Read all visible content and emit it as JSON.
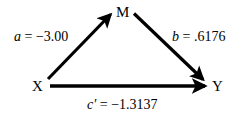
{
  "diagram": {
    "type": "mediation-path-diagram",
    "background_color": "#ffffff",
    "stroke_color": "#000000",
    "nodes": [
      {
        "id": "X",
        "label": "X",
        "role": "independent-variable",
        "x": 38,
        "y": 86
      },
      {
        "id": "M",
        "label": "M",
        "role": "mediator-variable",
        "x": 122,
        "y": 12
      },
      {
        "id": "Y",
        "label": "Y",
        "role": "dependent-variable",
        "x": 218,
        "y": 86
      }
    ],
    "paths": [
      {
        "id": "a",
        "from": "X",
        "to": "M",
        "coefficient_symbol": "a",
        "equals": "=",
        "value": "−3.00",
        "label": "a = −3.00"
      },
      {
        "id": "b",
        "from": "M",
        "to": "Y",
        "coefficient_symbol": "b",
        "equals": "=",
        "value": ".6176",
        "label": "b = .6176"
      },
      {
        "id": "c-prime",
        "from": "X",
        "to": "Y",
        "coefficient_symbol": "c′",
        "equals": "=",
        "value": "−1.3137",
        "label": "c′ = −1.3137"
      }
    ]
  }
}
